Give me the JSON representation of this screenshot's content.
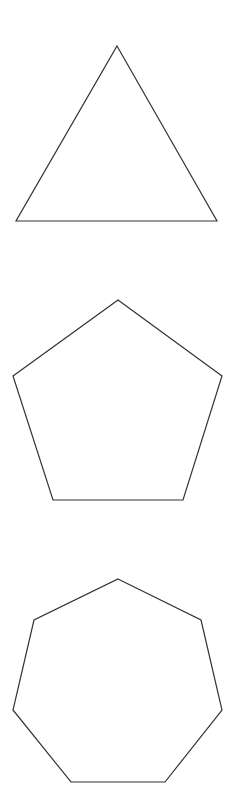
{
  "canvas": {
    "width": 245,
    "height": 808,
    "background": "#ffffff"
  },
  "style": {
    "stroke": "#333333"
  },
  "shapes": [
    {
      "name": "triangle",
      "sides": 3,
      "points": "117,46 217,221 16,221"
    },
    {
      "name": "pentagon",
      "sides": 5,
      "points": "118,300 222,376 183,500 53,500 13,376"
    },
    {
      "name": "heptagon",
      "sides": 7,
      "points": "118,579 201,620 222,710 165,782 71,782 13,710 34,620"
    }
  ]
}
